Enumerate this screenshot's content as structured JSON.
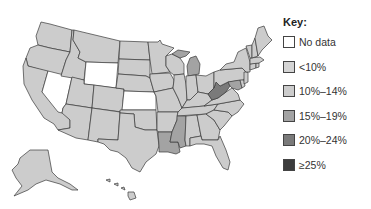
{
  "legend": {
    "title": "Key:",
    "items": [
      {
        "label": "No data",
        "color": "#ffffff"
      },
      {
        "label": "<10%",
        "color": "#d4d4d4"
      },
      {
        "label": "10%–14%",
        "color": "#cccccc"
      },
      {
        "label": "15%–19%",
        "color": "#a3a3a3"
      },
      {
        "label": "20%–24%",
        "color": "#7a7a7a"
      },
      {
        "label": "≥25%",
        "color": "#3c3c3c"
      }
    ]
  },
  "map": {
    "colors": {
      "no_data": "#ffffff",
      "lt10": "#d4d4d4",
      "10_14": "#cccccc",
      "15_19": "#a3a3a3",
      "20_24": "#7a7a7a",
      "ge25": "#3c3c3c"
    },
    "states": [
      {
        "name": "Washington",
        "category": "10_14"
      },
      {
        "name": "Oregon",
        "category": "10_14"
      },
      {
        "name": "California",
        "category": "10_14"
      },
      {
        "name": "Nevada",
        "category": "no_data"
      },
      {
        "name": "Idaho",
        "category": "10_14"
      },
      {
        "name": "Montana",
        "category": "10_14"
      },
      {
        "name": "Wyoming",
        "category": "no_data"
      },
      {
        "name": "Utah",
        "category": "10_14"
      },
      {
        "name": "Arizona",
        "category": "10_14"
      },
      {
        "name": "Colorado",
        "category": "10_14"
      },
      {
        "name": "New Mexico",
        "category": "10_14"
      },
      {
        "name": "North Dakota",
        "category": "10_14"
      },
      {
        "name": "South Dakota",
        "category": "10_14"
      },
      {
        "name": "Nebraska",
        "category": "10_14"
      },
      {
        "name": "Kansas",
        "category": "no_data"
      },
      {
        "name": "Oklahoma",
        "category": "10_14"
      },
      {
        "name": "Texas",
        "category": "10_14"
      },
      {
        "name": "Minnesota",
        "category": "10_14"
      },
      {
        "name": "Iowa",
        "category": "10_14"
      },
      {
        "name": "Missouri",
        "category": "10_14"
      },
      {
        "name": "Arkansas",
        "category": "10_14"
      },
      {
        "name": "Louisiana",
        "category": "15_19"
      },
      {
        "name": "Wisconsin",
        "category": "10_14"
      },
      {
        "name": "Illinois",
        "category": "10_14"
      },
      {
        "name": "Michigan",
        "category": "15_19"
      },
      {
        "name": "Indiana",
        "category": "10_14"
      },
      {
        "name": "Ohio",
        "category": "10_14"
      },
      {
        "name": "Kentucky",
        "category": "10_14"
      },
      {
        "name": "Tennessee",
        "category": "10_14"
      },
      {
        "name": "Mississippi",
        "category": "15_19"
      },
      {
        "name": "Alabama",
        "category": "10_14"
      },
      {
        "name": "Georgia",
        "category": "10_14"
      },
      {
        "name": "Florida",
        "category": "10_14"
      },
      {
        "name": "South Carolina",
        "category": "10_14"
      },
      {
        "name": "North Carolina",
        "category": "10_14"
      },
      {
        "name": "Virginia",
        "category": "10_14"
      },
      {
        "name": "West Virginia",
        "category": "20_24"
      },
      {
        "name": "Pennsylvania",
        "category": "10_14"
      },
      {
        "name": "New York",
        "category": "10_14"
      },
      {
        "name": "Maryland",
        "category": "15_19"
      },
      {
        "name": "Delaware",
        "category": "10_14"
      },
      {
        "name": "New Jersey",
        "category": "10_14"
      },
      {
        "name": "Connecticut",
        "category": "10_14"
      },
      {
        "name": "Rhode Island",
        "category": "10_14"
      },
      {
        "name": "Massachusetts",
        "category": "10_14"
      },
      {
        "name": "Vermont",
        "category": "10_14"
      },
      {
        "name": "New Hampshire",
        "category": "10_14"
      },
      {
        "name": "Maine",
        "category": "10_14"
      },
      {
        "name": "Alaska",
        "category": "10_14"
      },
      {
        "name": "Hawaii",
        "category": "10_14"
      }
    ]
  }
}
